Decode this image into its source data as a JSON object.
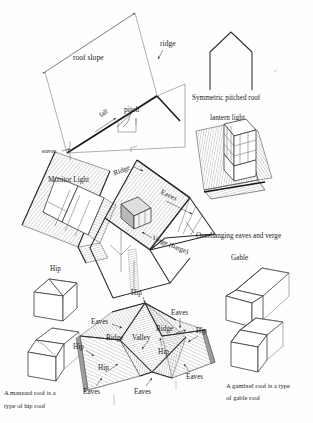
{
  "document": {
    "type": "architectural-line-diagram",
    "subject": "Roof terminology and roof types",
    "background_color": "#fefefe",
    "ink_color": "#1b1b1b"
  },
  "labels": {
    "roof_slope": "roof slope",
    "ridge_top": "ridge",
    "fall": "fall",
    "pitch": "pitch",
    "eaves_lower": "eaves",
    "symmetric_pitched_roof": "Symmetric pitched roof",
    "lantern_light": "lantern light",
    "monitor_light": "Monitor Light",
    "ridge_house": "Ridge",
    "eaves_house": "Eaves",
    "verge_barge": "Verge (barge)",
    "overhanging_eaves_and_verge": "Overhanging eaves and verge",
    "gable": "Gable",
    "hip_left_upper": "Hip",
    "hip_left_lower": "Hip",
    "mansard_caption_line1": "A mansard roof is a",
    "mansard_caption_line2": "type of hip roof",
    "gambrel_caption_line1": "A gambrel roof is a type",
    "gambrel_caption_line2": "of gable roof",
    "hip_complex": {
      "hip_top": "Hip",
      "hip_left": "Hip",
      "hip_right": "Hip",
      "hip_centre": "Hip",
      "hip_lower_left": "Hip",
      "ridge_centre": "Ridge",
      "ridge_left": "Ridge",
      "valley": "Valley",
      "eaves_upper_right": "Eaves",
      "eaves_left": "Eaves",
      "eaves_right": "Eaves",
      "eaves_bottom_left": "Eaves",
      "eaves_bottom_centre": "Eaves"
    }
  },
  "figures": [
    {
      "id": "roof-slope-parallelogram",
      "name": "Roof slope, fall, pitch and ridge definition figure"
    },
    {
      "id": "symmetric-pitched-roof",
      "name": "Symmetric pitched roof elevation"
    },
    {
      "id": "lantern-light",
      "name": "Lantern light roof detail"
    },
    {
      "id": "monitor-light",
      "name": "Monitor light roof detail"
    },
    {
      "id": "main-house",
      "name": "House with ridge, eaves and verge labelled"
    },
    {
      "id": "gable-box",
      "name": "Gable roof isometric block"
    },
    {
      "id": "gambrel-box",
      "name": "Gambrel roof isometric block"
    },
    {
      "id": "hip-box-upper",
      "name": "Hip roof isometric block"
    },
    {
      "id": "mansard-box",
      "name": "Mansard roof isometric block"
    },
    {
      "id": "hip-complex",
      "name": "Complex hipped roof with ridges, hips, valley and eaves"
    }
  ]
}
